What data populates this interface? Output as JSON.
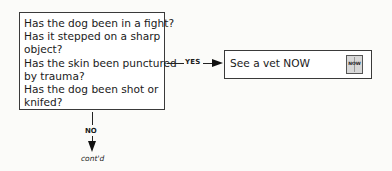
{
  "question_box": {
    "lines": [
      "Has the dog been in a fight?",
      "Has it stepped on a sharp",
      "object?",
      "Has the skin been punctured",
      "by trauma?",
      "Has the dog been shot or",
      "knifed?"
    ]
  },
  "yes_branch": {
    "label": "YES",
    "action": "See a vet NOW",
    "icon": {
      "name": "now-icon",
      "text": "NOW"
    }
  },
  "no_branch": {
    "label": "NO",
    "continuation": "cont'd"
  }
}
